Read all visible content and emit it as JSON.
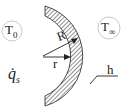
{
  "diagram": {
    "labels": {
      "inner_temperature": "T",
      "inner_temperature_sub": "0",
      "outer_temperature": "T",
      "outer_temperature_sub": "∞",
      "heat_generation": "q̇",
      "heat_generation_sub": "s",
      "outer_radius": "R",
      "radius": "r",
      "heat_transfer_coefficient": "h"
    },
    "colors": {
      "stroke": "#222222",
      "circle": "#bbbbbb",
      "background": "#ffffff"
    }
  }
}
